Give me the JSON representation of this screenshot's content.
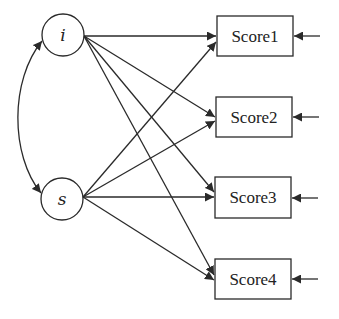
{
  "diagram": {
    "type": "latent growth curve path diagram",
    "colors": {
      "stroke": "#2a2a2a",
      "text": "#222222",
      "background": "#ffffff"
    },
    "latents": [
      {
        "id": "i",
        "label": "i",
        "cx": 63,
        "cy": 35,
        "r": 21
      },
      {
        "id": "s",
        "label": "s",
        "cx": 62,
        "cy": 199,
        "r": 21
      }
    ],
    "observed": [
      {
        "id": "Score1",
        "label": "Score1",
        "x": 217,
        "y": 16,
        "w": 76,
        "h": 40
      },
      {
        "id": "Score2",
        "label": "Score2",
        "x": 216,
        "y": 97,
        "w": 76,
        "h": 40
      },
      {
        "id": "Score3",
        "label": "Score3",
        "x": 215,
        "y": 177,
        "w": 76,
        "h": 41
      },
      {
        "id": "Score4",
        "label": "Score4",
        "x": 215,
        "y": 259,
        "w": 76,
        "h": 40
      }
    ],
    "paths": [
      {
        "from": "i",
        "to": "Score1"
      },
      {
        "from": "i",
        "to": "Score2"
      },
      {
        "from": "i",
        "to": "Score3"
      },
      {
        "from": "i",
        "to": "Score4"
      },
      {
        "from": "s",
        "to": "Score1"
      },
      {
        "from": "s",
        "to": "Score2"
      },
      {
        "from": "s",
        "to": "Score3"
      },
      {
        "from": "s",
        "to": "Score4"
      }
    ],
    "covariances": [
      {
        "between": [
          "i",
          "s"
        ],
        "style": "curved double-headed arrow"
      }
    ],
    "residual_arrows": [
      "Score1",
      "Score2",
      "Score3",
      "Score4"
    ]
  }
}
